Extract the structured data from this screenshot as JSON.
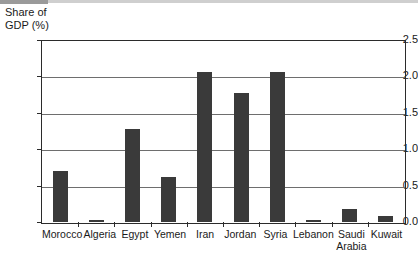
{
  "chart_data": {
    "type": "bar",
    "title": "Share of GDP (%)",
    "title_lines": "Share of\nGDP (%)",
    "xlabel": "",
    "ylabel": "Share of GDP (%)",
    "ylim": [
      0.0,
      2.5
    ],
    "grid": true,
    "legend": "none",
    "bar_color": "#3a3a3a",
    "ytick_labels": [
      "0.0",
      "0.5",
      "1.0",
      "1.5",
      "2.0",
      "2.5"
    ],
    "ytick_values": [
      0.0,
      0.5,
      1.0,
      1.5,
      2.0,
      2.5
    ],
    "categories": [
      "Morocco",
      "Algeria",
      "Egypt",
      "Yemen",
      "Iran",
      "Jordan",
      "Syria",
      "Lebanon",
      "Saudi\nArabia",
      "Kuwait"
    ],
    "values": [
      0.7,
      0.03,
      1.28,
      0.62,
      2.06,
      1.77,
      2.06,
      0.03,
      0.18,
      0.08
    ]
  }
}
